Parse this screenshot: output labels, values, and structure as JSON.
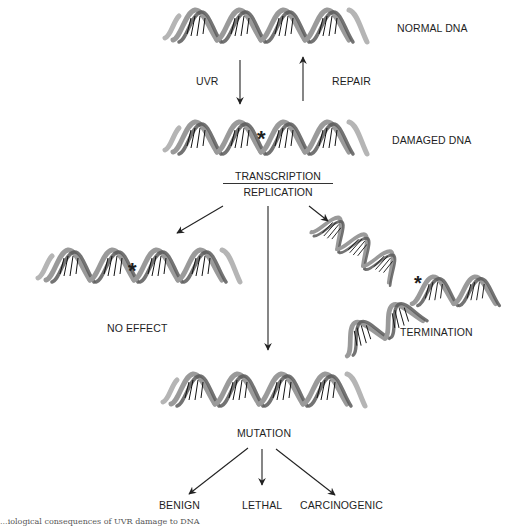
{
  "diagram": {
    "nodes": {
      "normal_dna": {
        "label": "NORMAL DNA"
      },
      "damaged_dna": {
        "label": "DAMAGED DNA",
        "marker": "*"
      },
      "process": {
        "top": "TRANSCRIPTION",
        "bottom": "REPLICATION"
      },
      "no_effect": {
        "label": "NO EFFECT",
        "marker": "*"
      },
      "termination": {
        "label": "TERMINATION",
        "marker": "*"
      },
      "mutation": {
        "label": "MUTATION"
      },
      "benign": {
        "label": "BENIGN"
      },
      "lethal": {
        "label": "LETHAL"
      },
      "carcinogenic": {
        "label": "CARCINOGENIC"
      }
    },
    "edges": [
      {
        "from": "normal_dna",
        "to": "damaged_dna",
        "label": "UVR"
      },
      {
        "from": "damaged_dna",
        "to": "normal_dna",
        "label": "REPAIR"
      },
      {
        "from": "process",
        "to": "no_effect",
        "label": ""
      },
      {
        "from": "process",
        "to": "mutation",
        "label": ""
      },
      {
        "from": "process",
        "to": "termination",
        "label": ""
      },
      {
        "from": "mutation",
        "to": "benign",
        "label": ""
      },
      {
        "from": "mutation",
        "to": "lethal",
        "label": ""
      },
      {
        "from": "mutation",
        "to": "carcinogenic",
        "label": ""
      }
    ],
    "caption_fragment": "...iological consequences of UVR damage to DNA",
    "colors": {
      "strand": "#9a9a9a",
      "strand_dark": "#4a4a4a",
      "rung": "#111111",
      "arrow": "#222222"
    }
  }
}
